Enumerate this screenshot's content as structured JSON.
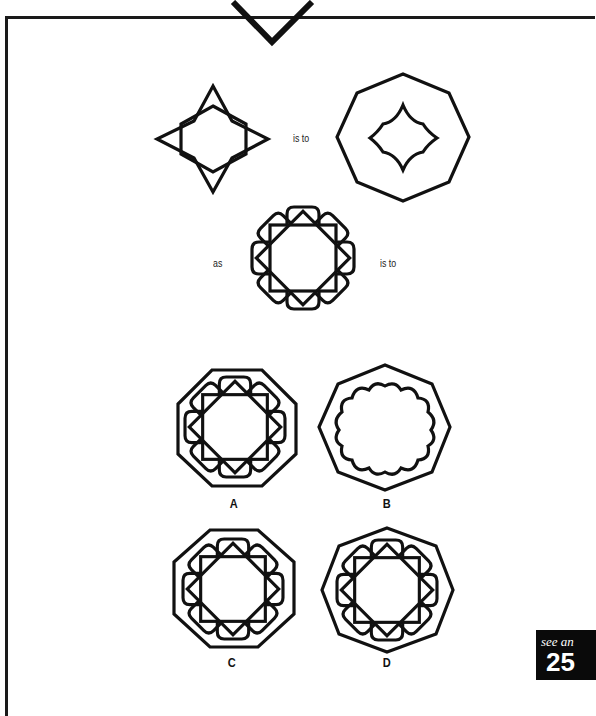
{
  "puzzle": {
    "relation": {
      "is_to_1": "is to",
      "as": "as",
      "is_to_2": "is to"
    },
    "options": [
      {
        "label": "A"
      },
      {
        "label": "B"
      },
      {
        "label": "C"
      },
      {
        "label": "D"
      }
    ]
  },
  "answer_ref": {
    "see_text": "see an",
    "page_number": "25"
  },
  "colors": {
    "stroke": "#111111",
    "background": "#ffffff",
    "answer_box": "#0a0a0a"
  }
}
